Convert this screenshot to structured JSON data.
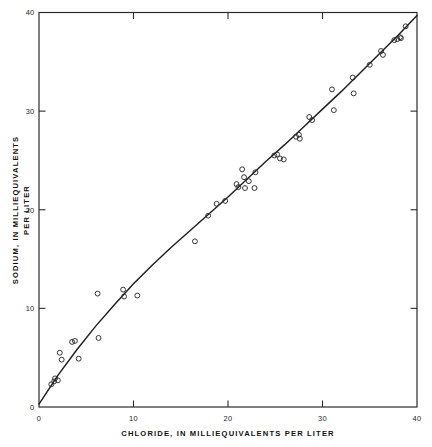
{
  "chart_data": {
    "type": "scatter",
    "title": "",
    "subtitle": "",
    "xlabel": "CHLORIDE, IN MILLIEQUIVALENTS PER LITER",
    "ylabel": "SODIUM, IN MILLIEQUIVALENTS PER LITER",
    "ylabel_line1": "SODIUM, IN MILLIEQUIVALENTS",
    "ylabel_line2": "PER LITER",
    "xlim": [
      0,
      40
    ],
    "ylim": [
      0,
      40
    ],
    "xticks": [
      0,
      10,
      20,
      30,
      40
    ],
    "yticks": [
      0,
      10,
      20,
      30,
      40
    ],
    "xticklabels": [
      "0",
      "10",
      "20",
      "30",
      "40"
    ],
    "yticklabels": [
      "0",
      "10",
      "20",
      "30",
      "40"
    ],
    "grid": false,
    "legend": null,
    "legend_position": "none",
    "frame": "box",
    "tick_direction": "in",
    "marker": "open-circle",
    "marker_color": "#2a2a2a",
    "line_color": "#1f1f1f",
    "background_color": "#ffffff",
    "annotations": [],
    "series": [
      {
        "name": "Sodium vs Chloride samples",
        "type": "scatter",
        "points": [
          [
            1.3,
            2.3
          ],
          [
            1.6,
            2.6
          ],
          [
            1.7,
            2.9
          ],
          [
            2.0,
            2.7
          ],
          [
            2.2,
            5.5
          ],
          [
            2.4,
            4.8
          ],
          [
            3.5,
            6.6
          ],
          [
            3.8,
            6.7
          ],
          [
            4.2,
            4.9
          ],
          [
            6.3,
            7.0
          ],
          [
            6.2,
            11.5
          ],
          [
            8.9,
            11.9
          ],
          [
            9.0,
            11.2
          ],
          [
            10.4,
            11.3
          ],
          [
            16.5,
            16.8
          ],
          [
            17.9,
            19.4
          ],
          [
            18.8,
            20.6
          ],
          [
            19.7,
            20.9
          ],
          [
            20.9,
            22.6
          ],
          [
            21.1,
            22.3
          ],
          [
            21.5,
            24.1
          ],
          [
            21.7,
            23.3
          ],
          [
            21.8,
            22.2
          ],
          [
            22.2,
            22.9
          ],
          [
            22.8,
            22.2
          ],
          [
            22.9,
            23.8
          ],
          [
            24.9,
            25.5
          ],
          [
            25.2,
            25.6
          ],
          [
            25.5,
            25.2
          ],
          [
            25.9,
            25.1
          ],
          [
            27.2,
            27.4
          ],
          [
            27.5,
            27.6
          ],
          [
            27.6,
            27.2
          ],
          [
            28.6,
            29.4
          ],
          [
            28.9,
            29.1
          ],
          [
            31.0,
            32.2
          ],
          [
            31.2,
            30.1
          ],
          [
            33.2,
            33.4
          ],
          [
            33.3,
            31.8
          ],
          [
            35.0,
            34.7
          ],
          [
            36.2,
            36.1
          ],
          [
            36.4,
            35.7
          ],
          [
            37.6,
            37.2
          ],
          [
            37.9,
            37.3
          ],
          [
            38.2,
            37.5
          ],
          [
            38.3,
            37.4
          ],
          [
            38.8,
            38.6
          ]
        ]
      },
      {
        "name": "fitted curve",
        "type": "line",
        "points": [
          [
            0.0,
            0.3
          ],
          [
            2.0,
            3.2
          ],
          [
            4.0,
            5.8
          ],
          [
            6.0,
            8.2
          ],
          [
            8.0,
            10.4
          ],
          [
            10.0,
            12.5
          ],
          [
            12.0,
            14.4
          ],
          [
            14.0,
            16.2
          ],
          [
            16.0,
            17.9
          ],
          [
            18.0,
            19.6
          ],
          [
            20.0,
            21.3
          ],
          [
            22.0,
            23.1
          ],
          [
            24.0,
            24.9
          ],
          [
            26.0,
            26.6
          ],
          [
            28.0,
            28.4
          ],
          [
            30.0,
            30.2
          ],
          [
            32.0,
            32.0
          ],
          [
            34.0,
            33.9
          ],
          [
            36.0,
            35.8
          ],
          [
            38.0,
            37.7
          ],
          [
            40.0,
            39.7
          ]
        ]
      }
    ]
  }
}
